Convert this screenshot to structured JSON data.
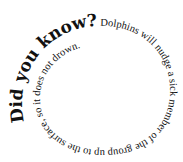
{
  "spiral": {
    "heading": "Did you know?",
    "body": " Dolphins will nudge a sick member of the group up to the surface, so it does not drown."
  },
  "colors": {
    "text": "#111111",
    "background": "#ffffff"
  }
}
